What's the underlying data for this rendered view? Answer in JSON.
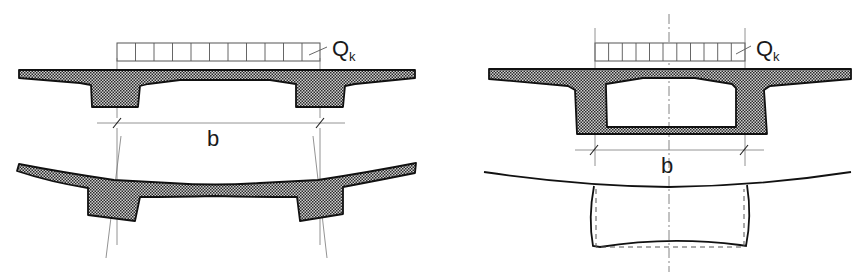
{
  "figure": {
    "left_panel": {
      "name": "T-beam double girder section",
      "load_label": "Q",
      "load_subscript": "k",
      "load_cells": 11,
      "dimension_label": "b",
      "states": [
        "undeformed cross-section under load",
        "deformed cross-section (transverse bending)"
      ]
    },
    "right_panel": {
      "name": "Box girder section",
      "load_label": "Q",
      "load_subscript": "k",
      "load_cells": 11,
      "dimension_label": "b",
      "states": [
        "undeformed cross-section under load",
        "deformed box frame (solid) vs original outline (dashed)"
      ]
    }
  },
  "colors": {
    "concrete_dark": "#2a2a2a",
    "concrete_light": "#d8d8d8",
    "line": "#111111",
    "construction_line": "#777777"
  }
}
